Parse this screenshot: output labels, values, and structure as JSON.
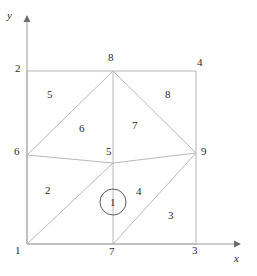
{
  "figure": {
    "type": "finite-element-mesh-diagram",
    "background_color": "#ffffff",
    "mesh_line_color": "#b0b0b0",
    "axis_line_color": "#9a9a9a",
    "text_color": "#2b2b2b",
    "circle_color": "#555555"
  },
  "axes": {
    "x_label": "x",
    "y_label": "y",
    "x_axis": {
      "x1": 27,
      "y1": 244,
      "x2": 236,
      "y2": 244
    },
    "y_axis": {
      "x1": 27,
      "y1": 244,
      "x2": 27,
      "y2": 20
    },
    "x_label_pos": {
      "x": 236,
      "y": 254
    },
    "y_label_pos": {
      "x": 8,
      "y": 10
    }
  },
  "nodes": [
    {
      "id": "1",
      "label": "1",
      "x": 27,
      "y": 244,
      "label_x": 15,
      "label_y": 248
    },
    {
      "id": "2",
      "label": "2",
      "x": 27,
      "y": 71,
      "label_x": 15,
      "label_y": 64
    },
    {
      "id": "3",
      "label": "3",
      "x": 196,
      "y": 244,
      "label_x": 192,
      "label_y": 248
    },
    {
      "id": "4",
      "label": "4",
      "x": 196,
      "y": 71,
      "label_x": 196,
      "label_y": 58
    },
    {
      "id": "5",
      "label": "5",
      "x": 113,
      "y": 163,
      "label_x": 106,
      "label_y": 148
    },
    {
      "id": "6",
      "label": "6",
      "x": 27,
      "y": 155,
      "label_x": 14,
      "label_y": 148
    },
    {
      "id": "7",
      "label": "7",
      "x": 113,
      "y": 244,
      "label_x": 109,
      "label_y": 248
    },
    {
      "id": "8",
      "label": "8",
      "x": 113,
      "y": 71,
      "label_x": 108,
      "label_y": 51
    },
    {
      "id": "9",
      "label": "9",
      "x": 196,
      "y": 153,
      "label_x": 200,
      "label_y": 147
    }
  ],
  "edges": [
    {
      "from": "1",
      "to": "2",
      "name": "edge-1-2"
    },
    {
      "from": "2",
      "to": "4",
      "name": "edge-2-4"
    },
    {
      "from": "4",
      "to": "3",
      "name": "edge-4-3"
    },
    {
      "from": "3",
      "to": "1",
      "name": "edge-3-1"
    },
    {
      "from": "6",
      "to": "8",
      "name": "edge-6-8"
    },
    {
      "from": "5",
      "to": "8",
      "name": "edge-5-8"
    },
    {
      "from": "9",
      "to": "8",
      "name": "edge-9-8"
    },
    {
      "from": "6",
      "to": "5",
      "name": "edge-6-5"
    },
    {
      "from": "5",
      "to": "9",
      "name": "edge-5-9"
    },
    {
      "from": "1",
      "to": "5",
      "name": "edge-1-5"
    },
    {
      "from": "5",
      "to": "7",
      "name": "edge-5-7"
    },
    {
      "from": "7",
      "to": "9",
      "name": "edge-7-9"
    }
  ],
  "elements": [
    {
      "id": "1",
      "label": "1",
      "label_x": 86,
      "label_y": 220,
      "circled": true,
      "circle": {
        "cx": 113,
        "cy": 202,
        "r": 13
      }
    },
    {
      "id": "2",
      "label": "2",
      "label_x": 47,
      "label_y": 190,
      "circled": false
    },
    {
      "id": "3",
      "label": "3",
      "label_x": 169,
      "label_y": 214,
      "circled": false
    },
    {
      "id": "4",
      "label": "4",
      "label_x": 138,
      "label_y": 190,
      "circled": false
    },
    {
      "id": "5",
      "label": "5",
      "label_x": 48,
      "label_y": 93,
      "circled": false
    },
    {
      "id": "6",
      "label": "6",
      "label_x": 80,
      "label_y": 127,
      "circled": false
    },
    {
      "id": "7",
      "label": "7",
      "label_x": 133,
      "label_y": 124,
      "circled": false
    },
    {
      "id": "8",
      "label": "8",
      "label_x": 166,
      "label_y": 93,
      "circled": false
    }
  ],
  "highlight": {
    "element_id": "1",
    "label": "1"
  }
}
